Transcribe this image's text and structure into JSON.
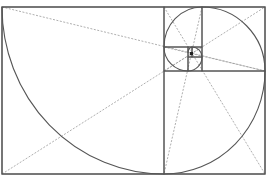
{
  "diagram": {
    "colors": {
      "background": "#ffffff",
      "solid_line": "#555555",
      "dashed_line": "#9a9a9a",
      "center_mark": "#222222"
    },
    "outer_rect": {
      "x": 2,
      "y": 7,
      "w": 263,
      "h": 167
    },
    "squares": [
      {
        "x": 2,
        "y": 7,
        "w": 162,
        "h": 167
      },
      {
        "x": 164,
        "y": 71,
        "w": 101,
        "h": 103
      },
      {
        "x": 202,
        "y": 7,
        "w": 63,
        "h": 64
      },
      {
        "x": 164,
        "y": 7,
        "w": 38,
        "h": 40
      },
      {
        "x": 164,
        "y": 47,
        "w": 24,
        "h": 24
      },
      {
        "x": 188,
        "y": 57,
        "w": 14,
        "h": 14
      },
      {
        "x": 192,
        "y": 47,
        "w": 10,
        "h": 10
      },
      {
        "x": 188,
        "y": 47,
        "w": 4,
        "h": 10
      }
    ],
    "spiral_arcs": [
      {
        "from": [
          2,
          7
        ],
        "to": [
          164,
          174
        ],
        "rx": 162,
        "ry": 167
      },
      {
        "from": [
          164,
          174
        ],
        "to": [
          265,
          71
        ],
        "rx": 101,
        "ry": 103
      },
      {
        "from": [
          265,
          71
        ],
        "to": [
          202,
          7
        ],
        "rx": 63,
        "ry": 64
      },
      {
        "from": [
          202,
          7
        ],
        "to": [
          164,
          47
        ],
        "rx": 38,
        "ry": 40
      },
      {
        "from": [
          164,
          47
        ],
        "to": [
          188,
          71
        ],
        "rx": 24,
        "ry": 24
      },
      {
        "from": [
          188,
          71
        ],
        "to": [
          202,
          57
        ],
        "rx": 14,
        "ry": 14
      },
      {
        "from": [
          202,
          57
        ],
        "to": [
          192,
          47
        ],
        "rx": 10,
        "ry": 10
      },
      {
        "from": [
          192,
          47
        ],
        "to": [
          188,
          53
        ],
        "rx": 5,
        "ry": 6
      }
    ],
    "dashed_diagonals": [
      {
        "from": [
          2,
          7
        ],
        "to": [
          265,
          71
        ]
      },
      {
        "from": [
          2,
          174
        ],
        "to": [
          265,
          7
        ]
      },
      {
        "from": [
          164,
          7
        ],
        "to": [
          265,
          174
        ]
      },
      {
        "from": [
          202,
          7
        ],
        "to": [
          164,
          174
        ]
      },
      {
        "from": [
          164,
          47
        ],
        "to": [
          265,
          71
        ]
      },
      {
        "from": [
          164,
          71
        ],
        "to": [
          202,
          47
        ]
      }
    ],
    "center_mark": {
      "x": 190,
      "y": 52,
      "w": 3,
      "h": 3
    }
  }
}
